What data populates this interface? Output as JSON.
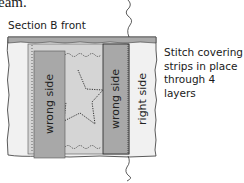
{
  "heading_fragment": "eam.",
  "diagram": {
    "title": "Section B front",
    "caption_lines": [
      "Stitch covering",
      "strips in place",
      "through 4 layers"
    ],
    "labels": {
      "left_strip": "wrong side",
      "right_strip": "wrong side",
      "right_panel": "right side"
    },
    "colors": {
      "background_fabric": "#f0f0f0",
      "top_band": "#a9a9a9",
      "strip": "#a8a8a8",
      "center_panel": "#d4d4d4",
      "stitch_line": "#333333"
    }
  }
}
